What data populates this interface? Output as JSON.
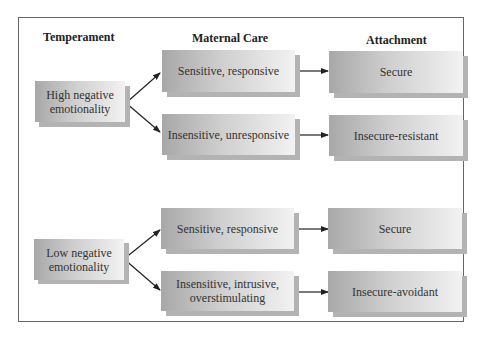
{
  "headers": {
    "temperament": "Temperament",
    "maternal_care": "Maternal Care",
    "attachment": "Attachment"
  },
  "groups": [
    {
      "temperament": "High negative emotionality",
      "temperament_lines": [
        "High negative",
        "emotionality"
      ],
      "paths": [
        {
          "care": "Sensitive, responsive",
          "attachment": "Secure"
        },
        {
          "care": "Insensitive, unresponsive",
          "attachment": "Insecure-resistant"
        }
      ]
    },
    {
      "temperament": "Low negative emotionality",
      "temperament_lines": [
        "Low negative",
        "emotionality"
      ],
      "paths": [
        {
          "care": "Sensitive, responsive",
          "attachment": "Secure"
        },
        {
          "care_lines": [
            "Insensitive, intrusive,",
            "overstimulating"
          ],
          "care": "Insensitive, intrusive, overstimulating",
          "attachment": "Insecure-avoidant"
        }
      ]
    }
  ],
  "colors": {
    "border": "#666666",
    "box_dark": "#a8a8a8",
    "box_light": "#f2f2f2",
    "shadow": "#b3b3b3",
    "arrow": "#222222"
  }
}
